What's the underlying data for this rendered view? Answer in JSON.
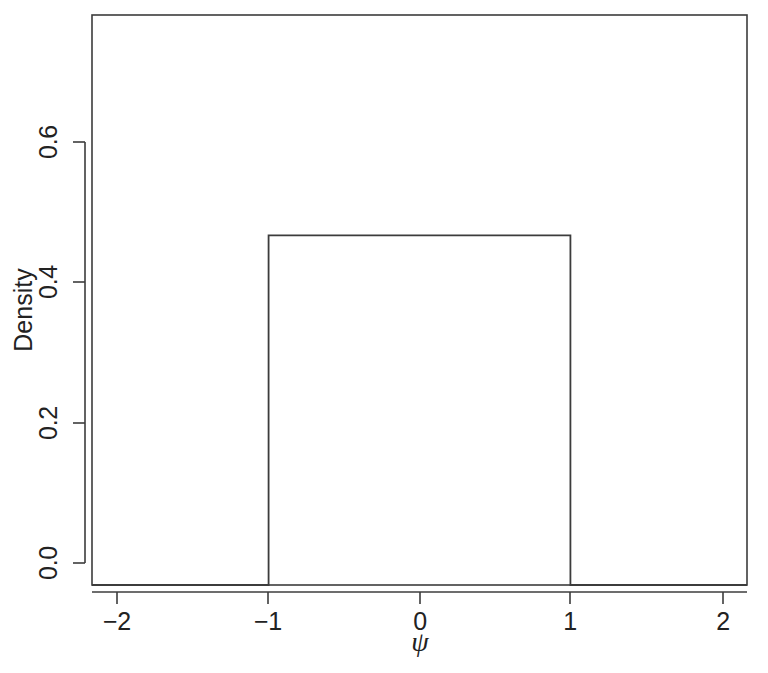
{
  "chart_data": {
    "type": "line",
    "title": "",
    "subtitle": "",
    "xlabel": "ψ",
    "ylabel": "Density",
    "style": "step",
    "x": [
      -2.17,
      -1.0,
      -1.0,
      1.0,
      1.0,
      2.17
    ],
    "y": [
      0.0,
      0.0,
      0.5,
      0.5,
      0.0,
      0.0
    ],
    "xlim": [
      -2.17,
      2.17
    ],
    "ylim": [
      0.0,
      0.815
    ],
    "xticks": [
      -2,
      -1,
      0,
      1,
      2
    ],
    "xtick_labels": [
      "−2",
      "−1",
      "0",
      "1",
      "2"
    ],
    "yticks": [
      0.0,
      0.2,
      0.4,
      0.6
    ],
    "ytick_labels": [
      "0.0",
      "0.2",
      "0.4",
      "0.6"
    ],
    "grid": false,
    "legend": null,
    "legend_position": "none",
    "plateau_value": 0.5,
    "support": [
      -1,
      1
    ],
    "line_color": "#3c3c3c",
    "axis_color": "#3c3c3c",
    "background_color": "#ffffff"
  },
  "axes": {
    "y_label": "Density",
    "x_label": "ψ"
  },
  "ticks": {
    "x": [
      {
        "label": "−2",
        "value": -2
      },
      {
        "label": "−1",
        "value": -1
      },
      {
        "label": "0",
        "value": 0
      },
      {
        "label": "1",
        "value": 1
      },
      {
        "label": "2",
        "value": 2
      }
    ],
    "y": [
      {
        "label": "0.0",
        "value": 0.0
      },
      {
        "label": "0.2",
        "value": 0.2
      },
      {
        "label": "0.4",
        "value": 0.4
      },
      {
        "label": "0.6",
        "value": 0.6
      }
    ]
  }
}
